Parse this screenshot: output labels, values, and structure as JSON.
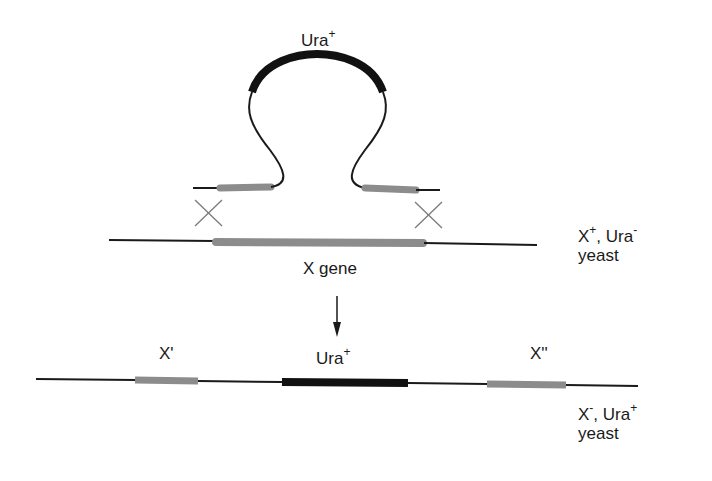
{
  "diagram": {
    "colors": {
      "dna_line": "#1a1a1a",
      "homology_segment": "#8c8c8c",
      "ura_marker": "#111111",
      "crossover": "#7a7a7a"
    },
    "plasmid": {
      "marker_label": "Ura",
      "marker_sup": "+"
    },
    "chromosome": {
      "gene_label": "X gene",
      "strain_label_gene": "X",
      "strain_label_gene_sup": "+",
      "strain_label_sep": ", Ura",
      "strain_label_ura_sup": "-",
      "strain_label_organism": "yeast"
    },
    "product": {
      "left_fragment": "X'",
      "marker_label": "Ura",
      "marker_sup": "+",
      "right_fragment": "X''",
      "strain_label_gene": "X",
      "strain_label_gene_sup": "-",
      "strain_label_sep": ", Ura",
      "strain_label_ura_sup": "+",
      "strain_label_organism": "yeast"
    }
  }
}
